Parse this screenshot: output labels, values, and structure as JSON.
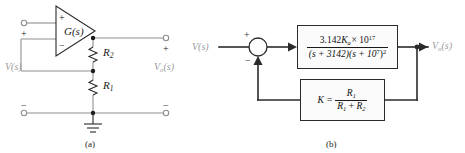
{
  "figure": {
    "panels": [
      {
        "id": "a",
        "caption": "(a)",
        "type": "op-amp-noninverting-amplifier-circuit",
        "labels": {
          "opamp_gain": "G(s)",
          "opamp_plus": "+",
          "opamp_minus": "−",
          "resistor_feedback": "R",
          "resistor_feedback_sub": "2",
          "resistor_ground": "R",
          "resistor_ground_sub": "1",
          "input_label": "V(s)",
          "output_label": "V",
          "output_label_sub": "o",
          "output_label_tail": "(s)",
          "input_terminal_plus": "+",
          "input_terminal_minus": "−",
          "output_terminal_plus": "+",
          "output_terminal_minus": "−",
          "ground_symbol": "ground"
        }
      },
      {
        "id": "b",
        "caption": "(b)",
        "type": "feedback-block-diagram",
        "labels": {
          "input_label": "V(s)",
          "output_label": "V",
          "output_label_sub": "o",
          "output_label_tail": "(s)",
          "summing_plus": "+",
          "summing_minus": "−"
        },
        "forward_block": {
          "numerator_prefix": "3.142",
          "numerator_gain": "K",
          "numerator_gain_sub": "a",
          "numerator_times": "× 10",
          "numerator_exponent": "17",
          "denominator_part1": "(s + 3142)(s + 10",
          "denominator_exponent1": "7",
          "denominator_part2": ")",
          "denominator_exponent2": "2"
        },
        "feedback_block": {
          "gain_symbol": "K",
          "equals": "=",
          "numerator": "R",
          "numerator_sub": "1",
          "denominator_first": "R",
          "denominator_first_sub": "1",
          "denominator_plus": " + ",
          "denominator_second": "R",
          "denominator_second_sub": "2"
        }
      }
    ],
    "colors": {
      "line": "#2a2a2a",
      "wire_gray": "#8f8f8f",
      "label_gray": "#9a9a9a",
      "text": "#1a1a1a",
      "block_fill": "#fbfbfb"
    }
  }
}
